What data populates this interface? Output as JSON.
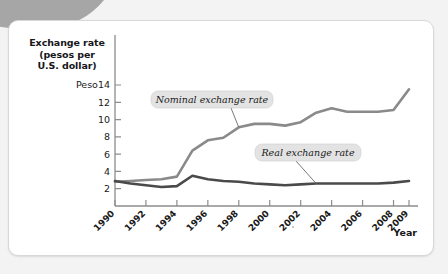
{
  "figure": {
    "y_axis_title_lines": [
      "Exchange rate",
      "(pesos per",
      "U.S. dollar)"
    ],
    "x_axis_name": "Year",
    "y_unit_prefix": "Peso"
  },
  "chart_data": {
    "type": "line",
    "title": "Exchange rate (pesos per U.S. dollar)",
    "xlabel": "Year",
    "ylabel": "Exchange rate (pesos per U.S. dollar)",
    "ylim": [
      0,
      14
    ],
    "xlim": [
      1990,
      2009
    ],
    "grid": false,
    "legend_position": "inline-callouts",
    "ytick_labels": [
      "Peso14",
      "12",
      "10",
      "8",
      "6",
      "4",
      "2"
    ],
    "ytick_values": [
      14,
      12,
      10,
      8,
      6,
      4,
      2
    ],
    "xtick_labels": [
      "1990",
      "1992",
      "1994",
      "1996",
      "1998",
      "2000",
      "2002",
      "2004",
      "2006",
      "2008",
      "2009"
    ],
    "xtick_values": [
      1990,
      1992,
      1994,
      1996,
      1998,
      2000,
      2002,
      2004,
      2006,
      2008,
      2009
    ],
    "x": [
      1990,
      1991,
      1992,
      1993,
      1994,
      1995,
      1996,
      1997,
      1998,
      1999,
      2000,
      2001,
      2002,
      2003,
      2004,
      2005,
      2006,
      2007,
      2008,
      2009
    ],
    "series": [
      {
        "name": "Nominal exchange rate",
        "color": "#8a8a8a",
        "values": [
          2.8,
          2.9,
          3.0,
          3.1,
          3.4,
          6.4,
          7.6,
          7.9,
          9.1,
          9.5,
          9.5,
          9.3,
          9.7,
          10.8,
          11.3,
          10.9,
          10.9,
          10.9,
          11.1,
          13.5
        ]
      },
      {
        "name": "Real exchange rate",
        "color": "#4a4a4a",
        "values": [
          2.9,
          2.6,
          2.4,
          2.2,
          2.3,
          3.5,
          3.1,
          2.9,
          2.8,
          2.6,
          2.5,
          2.4,
          2.5,
          2.6,
          2.6,
          2.6,
          2.6,
          2.6,
          2.7,
          2.9
        ]
      }
    ],
    "annotations": [
      {
        "label": "Nominal exchange rate",
        "points_to_year": 1998
      },
      {
        "label": "Real exchange rate",
        "points_to_year": 2003
      }
    ]
  }
}
